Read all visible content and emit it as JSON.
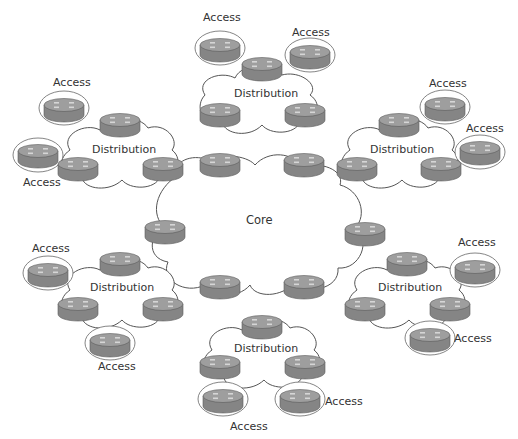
{
  "diagram": {
    "type": "hierarchical-network",
    "colors": {
      "router_body": "#8a8a8a",
      "router_top": "#9d9d9d",
      "router_dark": "#6f6f6f",
      "cloud_stroke": "#555555",
      "text": "#333333"
    },
    "core": {
      "label": "Core",
      "routers": 6
    },
    "distribution_blocks": [
      {
        "position": "top",
        "label": "Distribution",
        "access_labels": [
          "Access",
          "Access"
        ]
      },
      {
        "position": "upper-left",
        "label": "Distribution",
        "access_labels": [
          "Access",
          "Access"
        ]
      },
      {
        "position": "upper-right",
        "label": "Distribution",
        "access_labels": [
          "Access",
          "Access"
        ]
      },
      {
        "position": "lower-left",
        "label": "Distribution",
        "access_labels": [
          "Access",
          "Access"
        ]
      },
      {
        "position": "lower-right",
        "label": "Distribution",
        "access_labels": [
          "Access",
          "Access"
        ]
      },
      {
        "position": "bottom",
        "label": "Distribution",
        "access_labels": [
          "Access",
          "Access"
        ]
      }
    ]
  }
}
